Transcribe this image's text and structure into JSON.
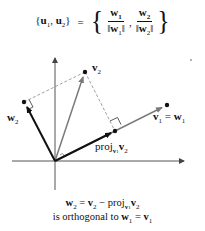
{
  "title_formula": {
    "lhs": "{u1, u2}",
    "lhs_parts": {
      "u1": "u",
      "u1_sub": "1",
      "u2": "u",
      "u2_sub": "2"
    },
    "equals": "=",
    "rhs_fractions": [
      {
        "num": "w",
        "num_sub": "1",
        "den": "‖w1‖",
        "den_vec": "w",
        "den_sub": "1"
      },
      {
        "num": "w",
        "num_sub": "2",
        "den": "‖w2‖",
        "den_vec": "w",
        "den_sub": "2"
      }
    ]
  },
  "diagram": {
    "origin": [
      55,
      161
    ],
    "points": {
      "v1": [
        167,
        105
      ],
      "v2": [
        85,
        72
      ],
      "w2": [
        24,
        102
      ],
      "proj": [
        115,
        131
      ]
    },
    "labels": {
      "v2": {
        "vec": "v",
        "sub": "2"
      },
      "w2": {
        "vec": "w",
        "sub": "2"
      },
      "v1_eq_w1": {
        "v": "v",
        "v_sub": "1",
        "eq": "=",
        "w": "w",
        "w_sub": "1"
      },
      "proj": {
        "text": "proj",
        "sub_vec": "v",
        "sub_sub": "1",
        "vec": "v",
        "vec_sub": "2"
      }
    },
    "colors": {
      "bold_vector": "#111111",
      "gray_vector": "#7a7a7a",
      "dashed": "#888888",
      "axis": "#555555"
    }
  },
  "caption": {
    "line1": {
      "w": "w",
      "w_sub": "2",
      "eq": "=",
      "v": "v",
      "v_sub": "2",
      "minus": "−",
      "proj": "proj",
      "proj_sub_vec": "v",
      "proj_sub_sub": "1",
      "proj_vec": "v",
      "proj_vec_sub": "2"
    },
    "line2": {
      "text": "is orthogonal to",
      "w": "w",
      "w_sub": "1",
      "eq": "=",
      "v": "v",
      "v_sub": "1"
    }
  }
}
